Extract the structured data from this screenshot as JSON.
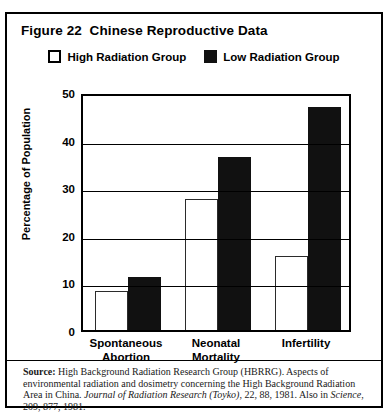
{
  "figure": {
    "title": "Figure 22  Chinese Reproductive Data"
  },
  "legend": {
    "items": [
      {
        "label": "High Radiation Group",
        "swatch": "white-square-icon",
        "color": "#ffffff"
      },
      {
        "label": "Low Radiation Group",
        "swatch": "black-square-icon",
        "color": "#111111"
      }
    ]
  },
  "source": {
    "label": "Source:",
    "text_1": " High Background Radiation Research Group (HBRRG). Aspects of environmental radiation and dosimetry concerning the High Background Radiation Area in China. ",
    "italic_1": "Journal of Radiation Research (Toyko)",
    "text_2": ", 22, 88, 1981. Also in ",
    "italic_2": "Science",
    "text_3": ", 209, 877, 1981."
  },
  "chart_data": {
    "type": "bar",
    "title": "Figure 22  Chinese Reproductive Data",
    "xlabel": "",
    "ylabel": "Percentage of Population",
    "categories": [
      "Spontaneous Abortion",
      "Neonatal Mortality",
      "Infertility"
    ],
    "category_lines": [
      [
        "Spontaneous",
        "Abortion"
      ],
      [
        "Neonatal",
        "Mortality"
      ],
      [
        "Infertility"
      ]
    ],
    "series": [
      {
        "name": "High Radiation Group",
        "color": "#ffffff",
        "values": [
          8.2,
          27.5,
          15.5
        ]
      },
      {
        "name": "Low Radiation Group",
        "color": "#111111",
        "values": [
          11.2,
          36.3,
          46.8
        ]
      }
    ],
    "ylim": [
      0,
      50
    ],
    "yticks": [
      0,
      10,
      20,
      30,
      40,
      50
    ],
    "ytick_labels": [
      "0",
      "10",
      "20",
      "30",
      "40",
      "50"
    ],
    "grid": true,
    "grid_axis": "y",
    "legend_position": "top-center"
  }
}
